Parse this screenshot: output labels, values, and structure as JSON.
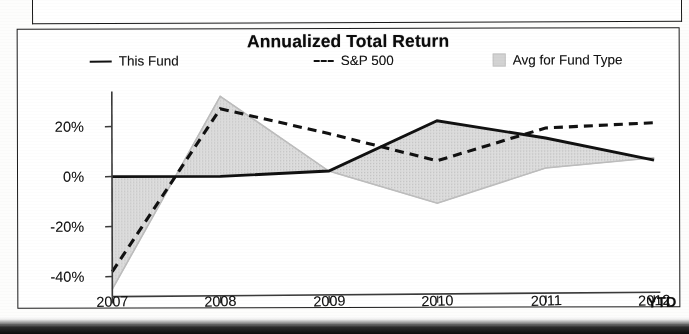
{
  "chart_data": {
    "type": "line",
    "title": "Annualized Total Return",
    "xlabel": "",
    "ylabel": "",
    "categories": [
      "2007",
      "2008",
      "2009",
      "2010",
      "2011",
      "2012"
    ],
    "x_axis_suffix_label": "YTD",
    "ylim": [
      -48,
      34
    ],
    "ytick_labels": [
      "20%",
      "0%",
      "-20%",
      "-40%"
    ],
    "ytick_values": [
      20,
      0,
      -20,
      -40
    ],
    "grid": false,
    "legend_position": "top",
    "series": [
      {
        "name": "This Fund",
        "style": "solid",
        "color": "#111111",
        "values": [
          0,
          0,
          2,
          22,
          15,
          6
        ]
      },
      {
        "name": "S&P 500",
        "style": "dashed",
        "color": "#111111",
        "values": [
          -38,
          27,
          17,
          6,
          19,
          21
        ]
      },
      {
        "name": "Avg for Fund Type",
        "style": "shaded-area",
        "color": "#d6d6d6",
        "values": [
          -45,
          32,
          2,
          -11,
          3,
          7
        ]
      }
    ]
  },
  "chart": {
    "title": "Annualized Total Return",
    "legend": [
      {
        "label": "This Fund",
        "marker": "solid-line-swatch"
      },
      {
        "label": "S&P 500",
        "marker": "dashed-line-swatch"
      },
      {
        "label": "Avg for Fund Type",
        "marker": "gray-area-swatch"
      }
    ],
    "y_axis": {
      "ticks": [
        {
          "label": "20%",
          "value": 20
        },
        {
          "label": "0%",
          "value": 0
        },
        {
          "label": "-20%",
          "value": -20
        },
        {
          "label": "-40%",
          "value": -40
        }
      ]
    },
    "x_axis": {
      "ticks": [
        {
          "label": "2007"
        },
        {
          "label": "2008"
        },
        {
          "label": "2009"
        },
        {
          "label": "2010"
        },
        {
          "label": "2011"
        },
        {
          "label": "2012"
        }
      ],
      "suffix": "YTD"
    }
  }
}
